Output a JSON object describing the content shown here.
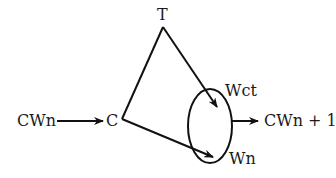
{
  "diagram": {
    "nodes": {
      "input": {
        "label": "CWn"
      },
      "c": {
        "label": "C"
      },
      "t": {
        "label": "T"
      },
      "wct": {
        "label": "Wct"
      },
      "wn": {
        "label": "Wn"
      },
      "output": {
        "label": "CWn + 1"
      }
    },
    "edges": [
      {
        "from": "CWn",
        "to": "C",
        "arrow": true
      },
      {
        "from": "C",
        "to": "T",
        "arrow": false
      },
      {
        "from": "T",
        "to": "Wct",
        "arrow": true
      },
      {
        "from": "C",
        "to": "Wn",
        "arrow": true
      },
      {
        "from": "group(Wct,Wn)",
        "to": "CWn + 1",
        "arrow": true
      }
    ],
    "group": {
      "members": [
        "Wct",
        "Wn"
      ],
      "shape": "ellipse"
    },
    "colors": {
      "stroke": "#111111",
      "text": "#1a1a1a",
      "background": "#ffffff"
    }
  }
}
